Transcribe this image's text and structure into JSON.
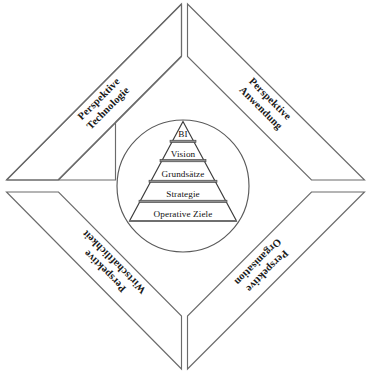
{
  "diagram": {
    "type": "concentric-diagram",
    "colors": {
      "background": "#ffffff",
      "outline": "#6b6b6b",
      "circle": "#5a5a5a",
      "pyramid_outline": "#3d3d3d",
      "divider_band": "#8e8e8e",
      "text": "#111111"
    },
    "quadrants": [
      {
        "id": "perspektive-technologie",
        "position": "top-left",
        "line1": "Perspektive",
        "line2": "Technologie",
        "rotation_deg": -45
      },
      {
        "id": "perspektive-anwendung",
        "position": "top-right",
        "line1": "Perspektive",
        "line2": "Anwendung",
        "rotation_deg": 45
      },
      {
        "id": "perspektive-wirtschaftlichkeit",
        "position": "bottom-left",
        "line1": "Perspektive",
        "line2": "Wirtschaftlichkeit",
        "rotation_deg": 225
      },
      {
        "id": "perspektive-organisation",
        "position": "bottom-right",
        "line1": "Perspektive",
        "line2": "Organisation",
        "rotation_deg": 135
      }
    ],
    "pyramid": {
      "id": "zielpyramide",
      "orientation": "apex-up",
      "levels": [
        {
          "rank": 1,
          "label": "BI"
        },
        {
          "rank": 2,
          "label": "Vision"
        },
        {
          "rank": 3,
          "label": "Grundsätze"
        },
        {
          "rank": 4,
          "label": "Strategie"
        },
        {
          "rank": 5,
          "label": "Operative Ziele"
        }
      ]
    },
    "circle": {
      "id": "umgebender-kreis",
      "center_x": 183,
      "center_y": 186,
      "radius": 66
    }
  }
}
